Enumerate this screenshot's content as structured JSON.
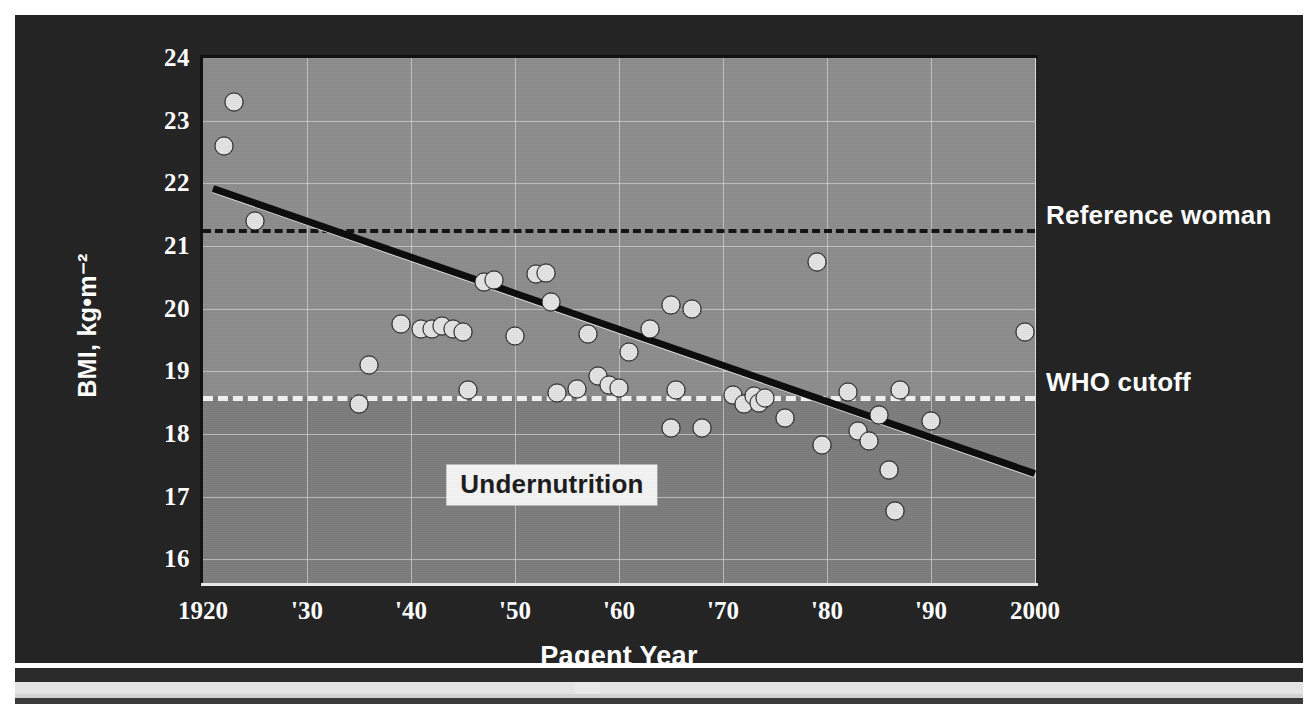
{
  "chart_data": {
    "type": "scatter",
    "title": "",
    "xlabel": "Pagent Year",
    "ylabel": "BMI, kg•m⁻²",
    "xlim": [
      1920,
      2000
    ],
    "ylim": [
      15.62,
      24.0
    ],
    "grid": true,
    "legend_position": "right-outside",
    "xticks": [
      {
        "value": 1920,
        "label": "1920"
      },
      {
        "value": 1930,
        "label": "'30"
      },
      {
        "value": 1940,
        "label": "'40"
      },
      {
        "value": 1950,
        "label": "'50"
      },
      {
        "value": 1960,
        "label": "'60"
      },
      {
        "value": 1970,
        "label": "'70"
      },
      {
        "value": 1980,
        "label": "'80"
      },
      {
        "value": 1990,
        "label": "'90"
      },
      {
        "value": 2000,
        "label": "2000"
      }
    ],
    "yticks": [
      {
        "value": 24,
        "label": "24"
      },
      {
        "value": 23,
        "label": "23"
      },
      {
        "value": 22,
        "label": "22"
      },
      {
        "value": 21,
        "label": "21"
      },
      {
        "value": 20,
        "label": "20"
      },
      {
        "value": 19,
        "label": "19"
      },
      {
        "value": 18,
        "label": "18"
      },
      {
        "value": 17,
        "label": "17"
      },
      {
        "value": 16,
        "label": "16"
      }
    ],
    "points": [
      {
        "x": 1923,
        "y": 23.3
      },
      {
        "x": 1922,
        "y": 22.6
      },
      {
        "x": 1925,
        "y": 21.4
      },
      {
        "x": 1936,
        "y": 19.1
      },
      {
        "x": 1935,
        "y": 18.47
      },
      {
        "x": 1939,
        "y": 19.75
      },
      {
        "x": 1941,
        "y": 19.68
      },
      {
        "x": 1942,
        "y": 19.67
      },
      {
        "x": 1943,
        "y": 19.73
      },
      {
        "x": 1944,
        "y": 19.68
      },
      {
        "x": 1945,
        "y": 19.62
      },
      {
        "x": 1945.5,
        "y": 18.7
      },
      {
        "x": 1947,
        "y": 20.42
      },
      {
        "x": 1948,
        "y": 20.45
      },
      {
        "x": 1950,
        "y": 19.57
      },
      {
        "x": 1952,
        "y": 20.55
      },
      {
        "x": 1953,
        "y": 20.57
      },
      {
        "x": 1953.5,
        "y": 20.1
      },
      {
        "x": 1954,
        "y": 18.66
      },
      {
        "x": 1956,
        "y": 18.72
      },
      {
        "x": 1957,
        "y": 19.6
      },
      {
        "x": 1958,
        "y": 18.93
      },
      {
        "x": 1959,
        "y": 18.78
      },
      {
        "x": 1960,
        "y": 18.74
      },
      {
        "x": 1961,
        "y": 19.31
      },
      {
        "x": 1963,
        "y": 19.67
      },
      {
        "x": 1965,
        "y": 20.05
      },
      {
        "x": 1965.5,
        "y": 18.7
      },
      {
        "x": 1965,
        "y": 18.1
      },
      {
        "x": 1967,
        "y": 20.0
      },
      {
        "x": 1968,
        "y": 18.1
      },
      {
        "x": 1971,
        "y": 18.62
      },
      {
        "x": 1972,
        "y": 18.48
      },
      {
        "x": 1973,
        "y": 18.6
      },
      {
        "x": 1973.5,
        "y": 18.5
      },
      {
        "x": 1974,
        "y": 18.58
      },
      {
        "x": 1976,
        "y": 18.25
      },
      {
        "x": 1979,
        "y": 20.75
      },
      {
        "x": 1979.5,
        "y": 17.82
      },
      {
        "x": 1982,
        "y": 18.67
      },
      {
        "x": 1983,
        "y": 18.05
      },
      {
        "x": 1984,
        "y": 17.88
      },
      {
        "x": 1985,
        "y": 18.3
      },
      {
        "x": 1986,
        "y": 17.42
      },
      {
        "x": 1986.5,
        "y": 16.77
      },
      {
        "x": 1987,
        "y": 18.7
      },
      {
        "x": 1990,
        "y": 18.2
      },
      {
        "x": 1999,
        "y": 19.62
      }
    ],
    "trend_line": {
      "x0": 1921,
      "y0": 21.9,
      "x1": 2000,
      "y1": 17.35,
      "style": "solid-black-with-white-highlight"
    },
    "reference_lines": [
      {
        "label": "Reference woman",
        "y": 21.27,
        "style": "dashed",
        "color": "#111111"
      },
      {
        "label": "WHO cutoff",
        "y": 18.6,
        "style": "dashed",
        "color": "#f2f2f2"
      }
    ],
    "region_labels": [
      {
        "label": "Undernutrition",
        "x": 1955,
        "y": 16.95
      }
    ]
  },
  "annotations": {
    "reference_woman": "Reference woman",
    "who_cutoff": "WHO cutoff",
    "undernutrition": "Undernutrition"
  },
  "colors": {
    "slide_background": "#232323",
    "plot_background": "#8d8d8d",
    "plot_background_low": "#7c7c7c",
    "marker_fill": "#e3e3e3",
    "marker_edge": "#2a2a2a",
    "gridline": "#e2e2e2",
    "text_light": "#ffffff",
    "trend_dark": "#0a0a0a",
    "trend_light": "#e6e6e6"
  }
}
